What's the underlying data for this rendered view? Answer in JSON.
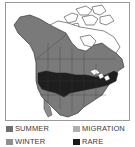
{
  "map": {
    "region": "North America",
    "colors": {
      "summer": "#7a7a7a",
      "winter": "#8c8c8c",
      "migration": "#b5b5b5",
      "rare": "#1e1e1e",
      "outside": "#ffffff",
      "border": "#3a3a3a"
    }
  },
  "legend": {
    "items": [
      {
        "label": "SUMMER",
        "color": "#6f6f6f"
      },
      {
        "label": "MIGRATION",
        "color": "#b0b0b0"
      },
      {
        "label": "WINTER",
        "color": "#8f8f8f"
      },
      {
        "label": "RARE",
        "color": "#1a1a1a"
      }
    ]
  }
}
